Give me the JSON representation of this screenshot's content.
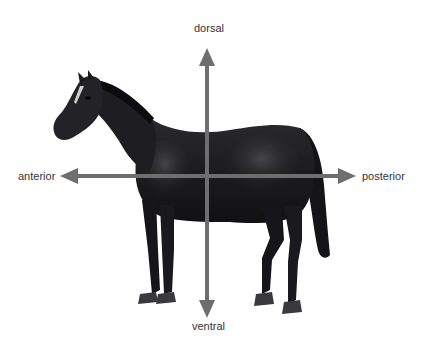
{
  "diagram": {
    "labels": {
      "top": "dorsal",
      "bottom": "ventral",
      "left": "anterior",
      "right": "posterior"
    },
    "colors": {
      "arrow": "#6e6e6e",
      "horse": "#1c1c1e",
      "horse_highlight": "#4a4a50",
      "text": "#333333",
      "background": "#ffffff"
    },
    "axes": {
      "vertical": {
        "x": 207,
        "y_top_tip": 48,
        "y_bottom_tip": 318
      },
      "horizontal": {
        "y": 176,
        "x_left_tip": 60,
        "x_right_tip": 356
      }
    }
  }
}
